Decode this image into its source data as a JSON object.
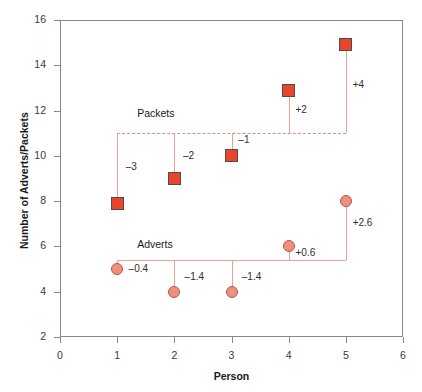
{
  "chart_data": {
    "type": "scatter",
    "title": "",
    "xlabel": "Person",
    "ylabel": "Number of Adverts/Packets",
    "xlim": [
      0,
      6
    ],
    "ylim": [
      2,
      16
    ],
    "xticks": [
      "0",
      "1",
      "2",
      "3",
      "4",
      "5",
      "6"
    ],
    "yticks": [
      "2",
      "4",
      "6",
      "8",
      "10",
      "12",
      "14",
      "16"
    ],
    "grid": false,
    "legend": "inline-series-labels",
    "x": [
      1,
      2,
      3,
      4,
      5
    ],
    "series": [
      {
        "name": "Packets",
        "marker": "square",
        "color": "#e8452c",
        "values": [
          7.9,
          9,
          10,
          12.9,
          14.9
        ],
        "reference_line": 11,
        "reference_line_style": "dashed",
        "deviations": [
          "–3",
          "–2",
          "–1",
          "+2",
          "+4"
        ]
      },
      {
        "name": "Adverts",
        "marker": "circle",
        "color": "#ef8f80",
        "values": [
          5,
          4,
          4,
          6,
          8
        ],
        "reference_line": 5.4,
        "reference_line_style": "solid",
        "deviations": [
          "–0.4",
          "–1.4",
          "–1.4",
          "+0.6",
          "+2.6"
        ]
      }
    ],
    "annotations": [
      {
        "text": "Packets",
        "x": 1.35,
        "y": 11.85
      },
      {
        "text": "Adverts",
        "x": 1.35,
        "y": 6.05
      },
      {
        "text": "–3",
        "x": 1.15,
        "y": 9.45
      },
      {
        "text": "–2",
        "x": 2.15,
        "y": 9.95
      },
      {
        "text": "–1",
        "x": 3.12,
        "y": 10.65
      },
      {
        "text": "+2",
        "x": 4.12,
        "y": 12.0
      },
      {
        "text": "+4",
        "x": 5.12,
        "y": 13.1
      },
      {
        "text": "–0.4",
        "x": 1.2,
        "y": 4.95
      },
      {
        "text": "–1.4",
        "x": 2.18,
        "y": 4.6
      },
      {
        "text": "–1.4",
        "x": 3.18,
        "y": 4.6
      },
      {
        "text": "+0.6",
        "x": 4.12,
        "y": 5.65
      },
      {
        "text": "+2.6",
        "x": 5.12,
        "y": 7.0
      }
    ]
  },
  "axis": {
    "x_title": "Person",
    "y_title": "Number of Adverts/Packets"
  },
  "colors": {
    "packets_marker": "#e8452c",
    "adverts_marker": "#ef8f80",
    "reference_line": "#eda196",
    "frame": "#888888",
    "text": "#1a1a1a"
  }
}
